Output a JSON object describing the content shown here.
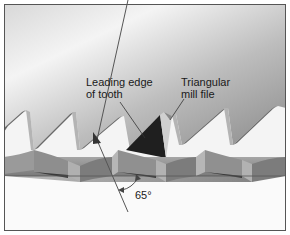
{
  "diagram": {
    "labels": {
      "leading_edge_line1": "Leading edge",
      "leading_edge_line2": "of tooth",
      "file_line1": "Triangular",
      "file_line2": "mill file",
      "angle": "65°"
    },
    "angle_value_deg": 65,
    "colors": {
      "background_top": "#f2f2f2",
      "background_gray": "#8c8c8c",
      "tooth_face": "#f4f4f4",
      "tooth_edge": "#6e6e6e",
      "tooth_bevel": "#a0a0a0",
      "file": "#222222",
      "set_band": "#8a8a8a",
      "set_band_dark": "#4a4a4a",
      "border": "#555555"
    }
  }
}
